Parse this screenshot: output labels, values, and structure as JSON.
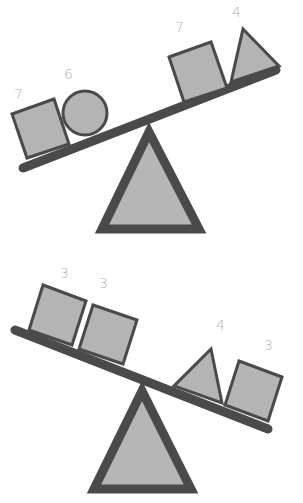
{
  "diagram": {
    "type": "balance-scale-puzzle",
    "colors": {
      "fill": "#b4b4b4",
      "outline": "#4a4a4a",
      "label": "#b0b0b0",
      "background": "#ffffff"
    },
    "scales": [
      {
        "id": "top",
        "tilt": "right-side-up (left side lower)",
        "left": [
          {
            "shape": "square",
            "label": "7"
          },
          {
            "shape": "circle",
            "label": "6"
          }
        ],
        "right": [
          {
            "shape": "square",
            "label": "7"
          },
          {
            "shape": "triangle",
            "label": "4"
          }
        ]
      },
      {
        "id": "bottom",
        "tilt": "left-side-up (right side lower)",
        "left": [
          {
            "shape": "square",
            "label": "3"
          },
          {
            "shape": "square",
            "label": "3"
          }
        ],
        "right": [
          {
            "shape": "triangle",
            "label": "4"
          },
          {
            "shape": "square",
            "label": "3"
          }
        ]
      }
    ]
  }
}
